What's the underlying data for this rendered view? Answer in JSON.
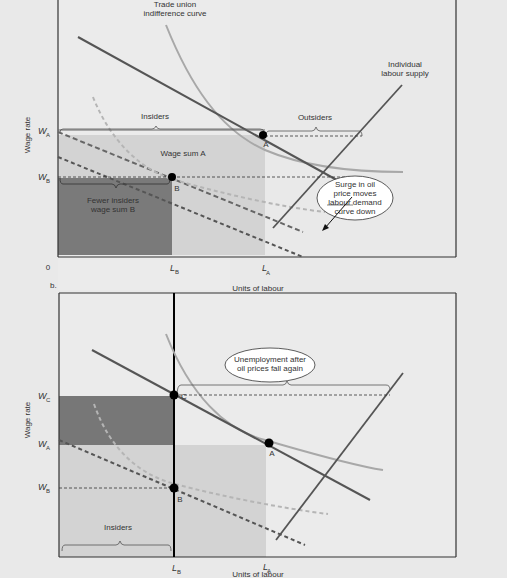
{
  "panel_a": {
    "label": "",
    "y_axis_label": "Wage rate",
    "x_axis_label": "Units of labour",
    "origin": "0",
    "W_A": "W",
    "W_A_sub": "A",
    "W_B": "W",
    "W_B_sub": "B",
    "L_B": "L",
    "L_B_sub": "B",
    "L_A": "L",
    "L_A_sub": "A",
    "point_A": "A",
    "point_B": "B",
    "insiders": "Insiders",
    "outsiders": "Outsiders",
    "wage_sum_a": "Wage sum A",
    "fewer_insiders_1": "Fewer insiders",
    "fewer_insiders_2": "wage sum B",
    "tu_curve_1": "Trade union",
    "tu_curve_2": "indifference curve",
    "supply_1": "Individual",
    "supply_2": "labour supply",
    "callout_1": "Surge in oil",
    "callout_2": "price moves",
    "callout_3": "labour demand",
    "callout_4": "curve down"
  },
  "panel_b": {
    "label": "b.",
    "y_axis_label": "Wage rate",
    "x_axis_label": "Units of labour",
    "W_C": "W",
    "W_C_sub": "C",
    "W_A": "W",
    "W_A_sub": "A",
    "W_B": "W",
    "W_B_sub": "B",
    "L_B": "L",
    "L_B_sub": "B",
    "L_A": "L",
    "L_A_sub": "A",
    "point_A": "A",
    "point_B": "B",
    "point_C": "C",
    "insiders": "Insiders",
    "callout_1": "Unemployment after",
    "callout_2": "oil prices fall again"
  },
  "colors": {
    "dark_fill": "#777777",
    "light_fill": "#cfcfcf",
    "mid_fill": "#d9d9d9",
    "demand": "#555555",
    "tu_curve": "#a8a8a8",
    "dashed_light": "#b5b5b5"
  }
}
